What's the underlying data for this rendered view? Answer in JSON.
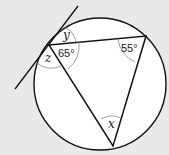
{
  "diagram": {
    "type": "circle-geometry",
    "colors": {
      "background": "#e9e9e9",
      "circle_fill": "#ffffff",
      "stroke": "#111111",
      "arc": "#888888"
    },
    "labels": {
      "y": "y",
      "z": "z",
      "x": "x",
      "angle_a": "65°",
      "angle_b": "55°"
    }
  }
}
